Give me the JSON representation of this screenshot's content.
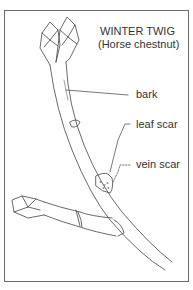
{
  "title": {
    "main": "WINTER TWIG",
    "sub": "(Horse chestnut)"
  },
  "labels": {
    "bark": "bark",
    "leaf_scar": "leaf scar",
    "vein_scar": "vein scar"
  }
}
